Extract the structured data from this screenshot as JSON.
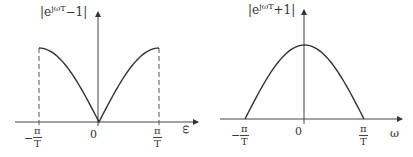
{
  "chart_data": [
    {
      "type": "line",
      "title": "|e^{jωT} − 1|",
      "ylabel_base": "|e",
      "ylabel_sup": "jωT",
      "ylabel_tail": "−1|",
      "xlabel": "ω",
      "x_ticks": [
        {
          "label_num": "π",
          "label_den": "T",
          "sign": "−",
          "value": -3.1416
        },
        {
          "label": "0",
          "value": 0
        },
        {
          "label_num": "π",
          "label_den": "T",
          "sign": "",
          "value": 3.1416
        }
      ],
      "x": [
        -3.1416,
        -2.3562,
        -1.5708,
        -0.7854,
        0,
        0.7854,
        1.5708,
        2.3562,
        3.1416
      ],
      "values": [
        2.0,
        1.848,
        1.414,
        0.765,
        0.0,
        0.765,
        1.414,
        1.848,
        2.0
      ],
      "xlim": [
        -3.1416,
        3.1416
      ],
      "ylim": [
        0,
        2
      ],
      "annotations": [
        "dashed vertical lines at ω = ±π/T"
      ],
      "grid": false,
      "color": "#333333"
    },
    {
      "type": "line",
      "title": "|e^{jωT} + 1|",
      "ylabel_base": "|e",
      "ylabel_sup": "jωT",
      "ylabel_tail": "+1|",
      "xlabel": "ω",
      "x_ticks": [
        {
          "label_num": "π",
          "label_den": "T",
          "sign": "−",
          "value": -3.1416
        },
        {
          "label": "0",
          "value": 0
        },
        {
          "label_num": "π",
          "label_den": "T",
          "sign": "",
          "value": 3.1416
        }
      ],
      "x": [
        -3.1416,
        -2.3562,
        -1.5708,
        -0.7854,
        0,
        0.7854,
        1.5708,
        2.3562,
        3.1416
      ],
      "values": [
        0.0,
        0.765,
        1.414,
        1.848,
        2.0,
        1.848,
        1.414,
        0.765,
        0.0
      ],
      "xlim": [
        -3.1416,
        3.1416
      ],
      "ylim": [
        0,
        2
      ],
      "grid": false,
      "color": "#333333"
    }
  ]
}
